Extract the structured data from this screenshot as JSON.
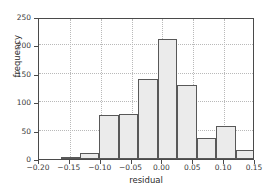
{
  "chart_data": {
    "type": "bar",
    "title": "",
    "subtitle": "",
    "xlabel": "residual",
    "ylabel": "frequency",
    "xlim": [
      -0.2,
      0.15
    ],
    "ylim": [
      0,
      250
    ],
    "grid": true,
    "legend": null,
    "xticks": [
      "-0.20",
      "-0.15",
      "-0.10",
      "-0.05",
      "0.00",
      "0.05",
      "0.10",
      "0.15"
    ],
    "xtick_values": [
      -0.2,
      -0.15,
      -0.1,
      -0.05,
      0.0,
      0.05,
      0.1,
      0.15
    ],
    "yticks": [
      "0",
      "50",
      "100",
      "150",
      "200",
      "250"
    ],
    "ytick_values": [
      0,
      50,
      100,
      150,
      200,
      250
    ],
    "bin_edges": [
      -0.165,
      -0.1335,
      -0.102,
      -0.0705,
      -0.039,
      -0.0075,
      0.024,
      0.0555,
      0.087,
      0.1185,
      0.15
    ],
    "bin_width": 0.0315,
    "categories": [
      "-0.165 to -0.134",
      "-0.134 to -0.102",
      "-0.102 to -0.071",
      "-0.071 to -0.039",
      "-0.039 to -0.008",
      "-0.008 to 0.024",
      "0.024 to 0.056",
      "0.056 to 0.087",
      "0.087 to 0.119",
      "0.119 to 0.150"
    ],
    "values": [
      4,
      10,
      78,
      80,
      140,
      212,
      130,
      37,
      59,
      15
    ],
    "bar_fill_color": "#ebebeb",
    "bar_edge_color": "#585858",
    "grid_color": "#b9b9b9",
    "axis_color": "#4a4a4a",
    "background_color": "#ffffff"
  },
  "axes": {
    "x_title": "residual",
    "y_title": "frequency"
  }
}
